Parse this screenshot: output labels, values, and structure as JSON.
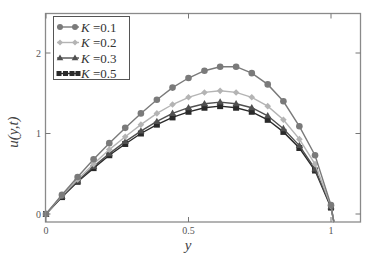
{
  "chart_data": {
    "type": "line",
    "title": "",
    "xlabel": "y",
    "ylabel": "u(y,t)",
    "xlim": [
      0,
      1.1
    ],
    "ylim": [
      -0.1,
      2.5
    ],
    "xticks": [
      0,
      0.5,
      1
    ],
    "xtick_labels": [
      "0",
      "0.5",
      "1"
    ],
    "yticks": [
      0,
      1,
      2
    ],
    "ytick_labels": [
      "0",
      "1",
      "2"
    ],
    "grid": false,
    "legend_position": "upper left",
    "x": [
      0,
      0.056,
      0.111,
      0.167,
      0.222,
      0.278,
      0.333,
      0.389,
      0.444,
      0.5,
      0.556,
      0.611,
      0.667,
      0.722,
      0.778,
      0.833,
      0.889,
      0.944,
      1.0
    ],
    "series": [
      {
        "name": "K=0.1",
        "legend_symbol": "K",
        "legend_value": "=0.1",
        "marker": "circle",
        "color": "#7a7a7a",
        "values": [
          0,
          0.24,
          0.46,
          0.68,
          0.88,
          1.07,
          1.25,
          1.42,
          1.57,
          1.69,
          1.78,
          1.83,
          1.83,
          1.75,
          1.61,
          1.4,
          1.09,
          0.73,
          0.11
        ]
      },
      {
        "name": "K=0.2",
        "legend_symbol": "K",
        "legend_value": "=0.2",
        "marker": "diamond",
        "color": "#b4b4b4",
        "values": [
          0,
          0.23,
          0.43,
          0.62,
          0.8,
          0.96,
          1.11,
          1.25,
          1.36,
          1.45,
          1.51,
          1.53,
          1.51,
          1.45,
          1.34,
          1.17,
          0.93,
          0.62,
          0.1
        ]
      },
      {
        "name": "K=0.3",
        "legend_symbol": "K",
        "legend_value": "=0.3",
        "marker": "triangle",
        "color": "#505050",
        "values": [
          0,
          0.22,
          0.41,
          0.59,
          0.75,
          0.9,
          1.03,
          1.15,
          1.25,
          1.32,
          1.37,
          1.39,
          1.37,
          1.32,
          1.22,
          1.06,
          0.85,
          0.56,
          0.09
        ]
      },
      {
        "name": "K=0.5",
        "legend_symbol": "K",
        "legend_value": "=0.5",
        "marker": "square",
        "color": "#2a2a2a",
        "values": [
          0,
          0.21,
          0.4,
          0.57,
          0.73,
          0.87,
          1.0,
          1.11,
          1.2,
          1.27,
          1.32,
          1.34,
          1.32,
          1.27,
          1.17,
          1.02,
          0.82,
          0.54,
          0.08
        ]
      }
    ],
    "tail_point": {
      "x": 1.01,
      "u": -0.1
    }
  }
}
